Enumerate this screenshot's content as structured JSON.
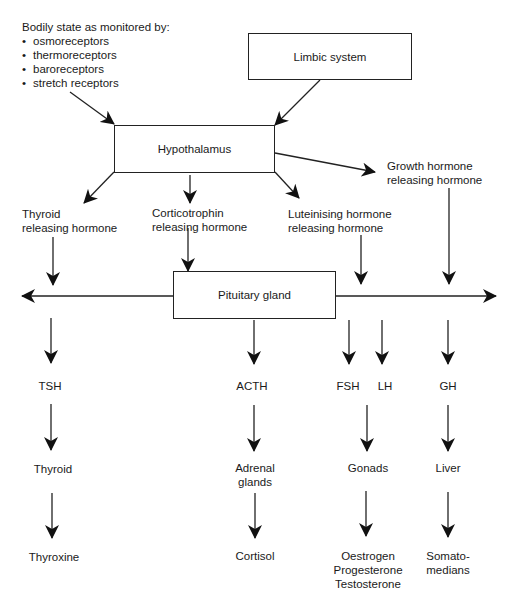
{
  "monitor": {
    "title": "Bodily state as monitored by:",
    "items": [
      "osmoreceptors",
      "thermoreceptors",
      "baroreceptors",
      "stretch receptors"
    ]
  },
  "boxes": {
    "limbic": "Limbic system",
    "hypothalamus": "Hypothalamus",
    "pituitary": "Pituitary gland"
  },
  "releasing": {
    "trh": [
      "Thyroid",
      "releasing hormone"
    ],
    "crh": [
      "Corticotrophin",
      "releasing hormone"
    ],
    "lhrh": [
      "Luteinising hormone",
      "releasing hormone"
    ],
    "ghrh": [
      "Growth hormone",
      "releasing hormone"
    ]
  },
  "pituitary_hormones": {
    "tsh": "TSH",
    "acth": "ACTH",
    "fsh": "FSH",
    "lh": "LH",
    "gh": "GH"
  },
  "targets": {
    "thyroid": "Thyroid",
    "adrenal": [
      "Adrenal",
      "glands"
    ],
    "gonads": "Gonads",
    "liver": "Liver"
  },
  "products": {
    "thyroxine": "Thyroxine",
    "cortisol": "Cortisol",
    "sex_steroids": [
      "Oestrogen",
      "Progesterone",
      "Testosterone"
    ],
    "somatomedians": [
      "Somato-",
      "medians"
    ]
  }
}
